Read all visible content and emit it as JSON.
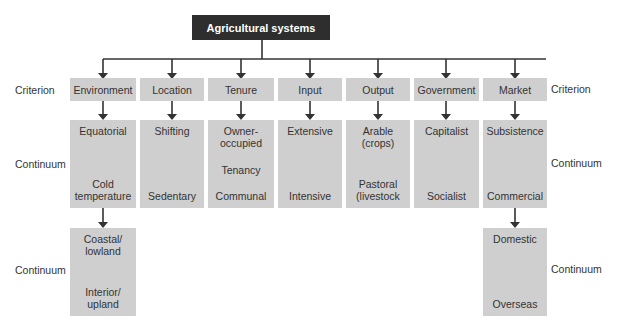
{
  "title": "Agricultural systems",
  "side_labels": {
    "criterion_left": "Criterion",
    "criterion_right": "Criterion",
    "continuum_left": "Continuum",
    "continuum_right": "Continuum",
    "continuum2_left": "Continuum",
    "continuum2_right": "Continuum"
  },
  "columns": [
    {
      "criterion": "Environment",
      "top": "Equatorial",
      "bottom_1": "Cold",
      "bottom_2": "temperature"
    },
    {
      "criterion": "Location",
      "top": "Shifting",
      "bottom": "Sedentary"
    },
    {
      "criterion": "Tenure",
      "top_1": "Owner-",
      "top_2": "occupied",
      "middle": "Tenancy",
      "bottom": "Communal"
    },
    {
      "criterion": "Input",
      "top": "Extensive",
      "bottom": "Intensive"
    },
    {
      "criterion": "Output",
      "top_1": "Arable",
      "top_2": "(crops)",
      "bottom_1": "Pastoral",
      "bottom_2": "(livestock"
    },
    {
      "criterion": "Government",
      "top": "Capitalist",
      "bottom": "Socialist"
    },
    {
      "criterion": "Market",
      "top": "Subsistence",
      "bottom": "Commercial"
    }
  ],
  "second_level": {
    "environment": {
      "top_1": "Coastal/",
      "top_2": "lowland",
      "bottom_1": "Interior/",
      "bottom_2": "upland"
    },
    "market": {
      "top": "Domestic",
      "bottom": "Overseas"
    }
  },
  "colors": {
    "title_bg": "#2e2e2e",
    "box_bg": "#cfcfcf",
    "arrow": "#333333"
  }
}
